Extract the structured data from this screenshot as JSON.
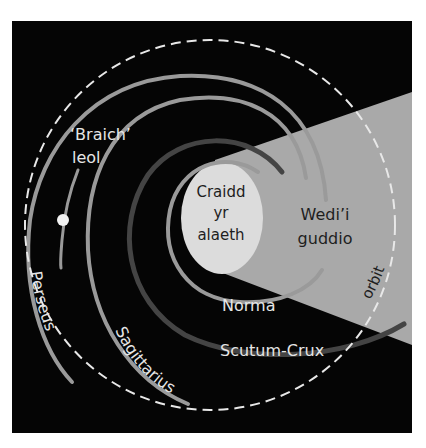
{
  "diagram": {
    "type": "galaxy-map",
    "colors": {
      "background": "#ffffff",
      "panel": "#050505",
      "hidden_zone": "#a9a9a9",
      "core": "#dcdcdc",
      "arm_light": "#9a9a9a",
      "arm_dark": "#444444",
      "orbit": "#e8e8e8",
      "sun": "#f2f2f2",
      "label_light": "#e6e6e6",
      "label_dark": "#1e1e1e"
    },
    "labels": {
      "local_arm_line1": "‘Braich’",
      "local_arm_line2": "leol",
      "core_line1": "Craidd",
      "core_line2": "yr",
      "core_line3": "alaeth",
      "hidden_line1": "Wedi’i",
      "hidden_line2": "guddio",
      "norma": "Norma",
      "scutum_crux": "Scutum-Crux",
      "sagittarius": "Sagittarius",
      "perseus": "Perseus",
      "orbit": "orbit"
    },
    "arms": [
      {
        "name": "Norma",
        "shade": "light"
      },
      {
        "name": "Scutum-Crux",
        "shade": "dark"
      },
      {
        "name": "Sagittarius",
        "shade": "light"
      },
      {
        "name": "Perseus",
        "shade": "light"
      },
      {
        "name": "‘Braich’ leol",
        "shade": "light"
      }
    ]
  }
}
